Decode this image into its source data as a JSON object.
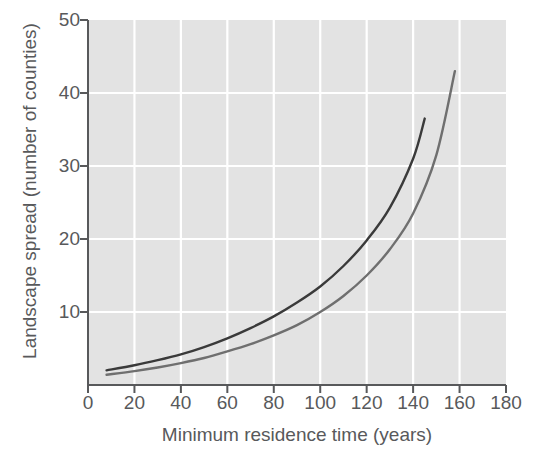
{
  "figure": {
    "background_color": "#ffffff",
    "plot_background_color": "#e3e3e3",
    "grid_color": "#ffffff",
    "axis_color": "#58595b",
    "text_color": "#58595b"
  },
  "chart_data": {
    "type": "line",
    "title": "",
    "xlabel": "Minimum residence time (years)",
    "ylabel": "Landscape spread (number of counties)",
    "xlim": [
      0,
      180
    ],
    "ylim": [
      0,
      50
    ],
    "xticks": [
      0,
      20,
      40,
      60,
      80,
      100,
      120,
      140,
      160,
      180
    ],
    "yticks": [
      10,
      20,
      30,
      40,
      50
    ],
    "grid": true,
    "grid_axis": "both",
    "legend": "none",
    "series": [
      {
        "name": "upper-curve",
        "color": "#3a3a3a",
        "linewidth": 2.4,
        "x": [
          8,
          20,
          30,
          40,
          50,
          60,
          70,
          80,
          90,
          100,
          110,
          120,
          130,
          140,
          145
        ],
        "y": [
          2.0,
          2.7,
          3.4,
          4.2,
          5.2,
          6.4,
          7.8,
          9.4,
          11.3,
          13.5,
          16.3,
          19.8,
          24.3,
          31.0,
          36.5
        ]
      },
      {
        "name": "lower-curve",
        "color": "#6f6f6f",
        "linewidth": 2.4,
        "x": [
          8,
          20,
          30,
          40,
          50,
          60,
          70,
          80,
          90,
          100,
          110,
          120,
          130,
          140,
          150,
          158
        ],
        "y": [
          1.4,
          1.9,
          2.4,
          3.0,
          3.7,
          4.6,
          5.6,
          6.8,
          8.2,
          10.0,
          12.2,
          15.0,
          18.6,
          23.5,
          31.5,
          43.0
        ]
      }
    ]
  }
}
